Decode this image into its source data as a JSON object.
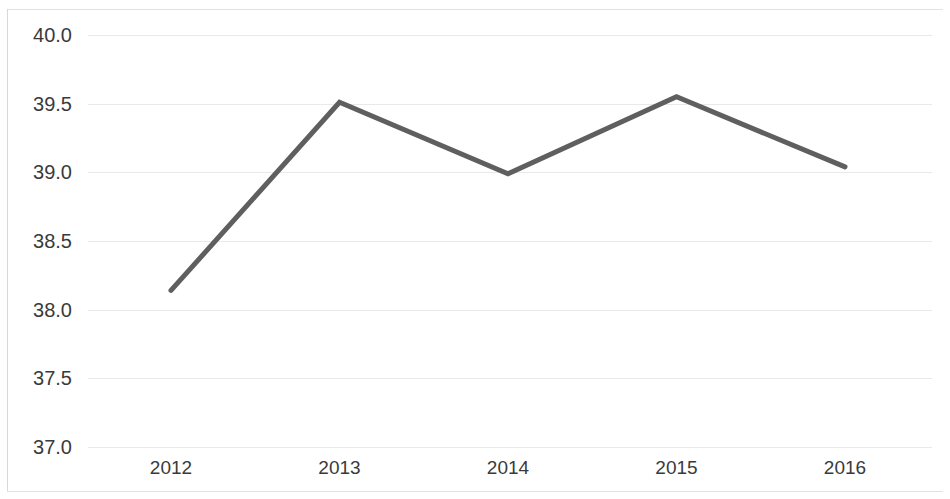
{
  "chart_data": {
    "type": "line",
    "title": "",
    "subtitle": "",
    "xlabel": "",
    "ylabel": "",
    "categories": [
      "2012",
      "2013",
      "2014",
      "2015",
      "2016"
    ],
    "series": [
      {
        "name": "",
        "values": [
          38.14,
          39.51,
          38.99,
          39.55,
          39.04
        ]
      }
    ],
    "ylim": [
      37.0,
      40.0
    ],
    "y_ticks": [
      "37.0",
      "37.5",
      "38.0",
      "38.5",
      "39.0",
      "39.5",
      "40.0"
    ],
    "y_tick_values": [
      37.0,
      37.5,
      38.0,
      38.5,
      39.0,
      39.5,
      40.0
    ],
    "grid": true,
    "legend": "none",
    "markers": false,
    "line_color": "#5f5f5f",
    "grid_color": "#e9e9e9",
    "text_color": "#3a3a3a",
    "background_color": "#ffffff"
  }
}
